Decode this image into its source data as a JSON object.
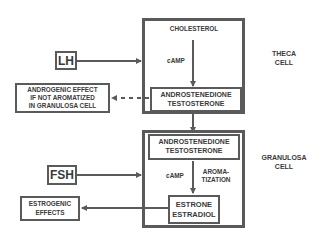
{
  "diagram": {
    "theca": {
      "label": "THECA\nCELL",
      "cholesterol": "CHOLESTEROL",
      "camp": "cAMP",
      "product": "ANDROSTENEDIONE\nTESTOSTERONE"
    },
    "granulosa": {
      "label": "GRANULOSA\nCELL",
      "substrate": "ANDROSTENEDIONE\nTESTOSTERONE",
      "camp": "cAMP",
      "aromatization": "AROMA-\nTIZATION",
      "product": "ESTRONE\nESTRADIOL"
    },
    "inputs": {
      "lh": "LH",
      "fsh": "FSH"
    },
    "outputs": {
      "androgenic": "ANDROGENIC EFFECT\nIF NOT AROMATIZED\nIN GRANULOSA CELL",
      "estrogenic": "ESTROGENIC\nEFFECTS"
    },
    "colors": {
      "line": "#5a5a5a",
      "text": "#3a3a3a",
      "background": "#ffffff"
    }
  }
}
